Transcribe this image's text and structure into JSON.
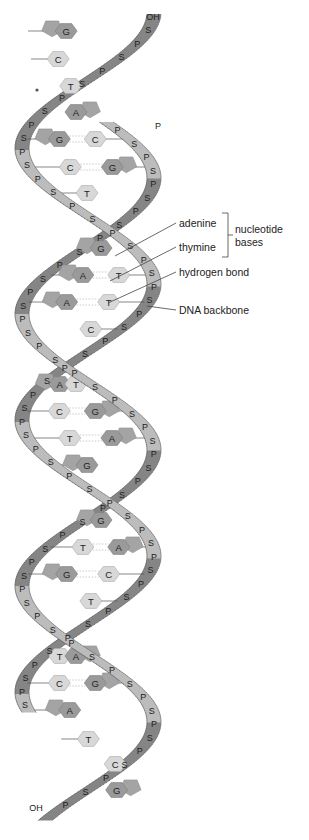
{
  "labels": {
    "adenine": "adenine",
    "thymine": "thymine",
    "nucleotide_bases": [
      "nucleotide",
      "bases"
    ],
    "hydrogen_bond": "hydrogen bond",
    "dna_backbone": "DNA backbone"
  },
  "strand_ends": {
    "top": "OH",
    "top_right": "P",
    "bottom": "OH"
  },
  "colors": {
    "strand_dark": "#7d7d7d",
    "strand_light": "#b9b9b9",
    "strand_edge": "#555555",
    "base_purine": "#9a9a9a",
    "base_pyrimidine": "#d6d6d6",
    "text": "#222222"
  },
  "base_pairs": [
    {
      "y": 31,
      "left": "G",
      "right": ""
    },
    {
      "y": 59,
      "left": "C",
      "right": ""
    },
    {
      "y": 86,
      "left": "",
      "right": "T"
    },
    {
      "y": 112,
      "left": "",
      "right": "A"
    },
    {
      "y": 139,
      "left": "G",
      "right": "C"
    },
    {
      "y": 167,
      "left": "C",
      "right": "G"
    },
    {
      "y": 193,
      "left": "T",
      "right": ""
    },
    {
      "y": 248,
      "left": "G",
      "right": ""
    },
    {
      "y": 275,
      "left": "A",
      "right": "T"
    },
    {
      "y": 302,
      "left": "A",
      "right": "T"
    },
    {
      "y": 329,
      "left": "",
      "right": "C"
    },
    {
      "y": 384,
      "left": "A",
      "right": "T"
    },
    {
      "y": 411,
      "left": "C",
      "right": "G"
    },
    {
      "y": 438,
      "left": "T",
      "right": "A"
    },
    {
      "y": 465,
      "left": "G",
      "right": ""
    },
    {
      "y": 520,
      "left": "G",
      "right": ""
    },
    {
      "y": 547,
      "left": "T",
      "right": "A"
    },
    {
      "y": 574,
      "left": "G",
      "right": "C"
    },
    {
      "y": 601,
      "left": "",
      "right": "T"
    },
    {
      "y": 656,
      "left": "T",
      "right": "A"
    },
    {
      "y": 683,
      "left": "C",
      "right": "G"
    },
    {
      "y": 710,
      "left": "A",
      "right": ""
    },
    {
      "y": 739,
      "left": "T",
      "right": ""
    },
    {
      "y": 764,
      "left": "",
      "right": "C"
    },
    {
      "y": 790,
      "left": "",
      "right": "G"
    }
  ]
}
